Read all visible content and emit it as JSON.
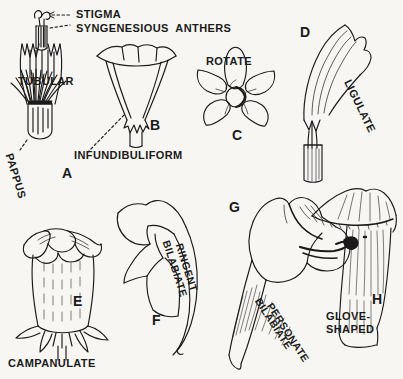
{
  "plate": {
    "title": "Corolla Forms",
    "background_color": "#f7f6f2",
    "ink_color": "#1a1a1a"
  },
  "callouts": [
    {
      "id": "stigma",
      "text": "STIGMA"
    },
    {
      "id": "syngenesious-anthers",
      "text": "SYNGENESIOUS  ANTHERS"
    },
    {
      "id": "pappus",
      "text": "PAPPUS"
    }
  ],
  "figures": [
    {
      "letter": "A",
      "term": "TUBULAR"
    },
    {
      "letter": "B",
      "term": "INFUNDIBULIFORM"
    },
    {
      "letter": "C",
      "term": "ROTATE"
    },
    {
      "letter": "D",
      "term": "LIGULATE"
    },
    {
      "letter": "E",
      "term": "CAMPANULATE"
    },
    {
      "letter": "F",
      "term_line1": "BILABIATE",
      "term_line2": "RINGENT"
    },
    {
      "letter": "G",
      "term_line1": "BILABIATE",
      "term_line2": "PERSONATE"
    },
    {
      "letter": "H",
      "term_line1": "GLOVE-",
      "term_line2": "SHAPED"
    }
  ]
}
